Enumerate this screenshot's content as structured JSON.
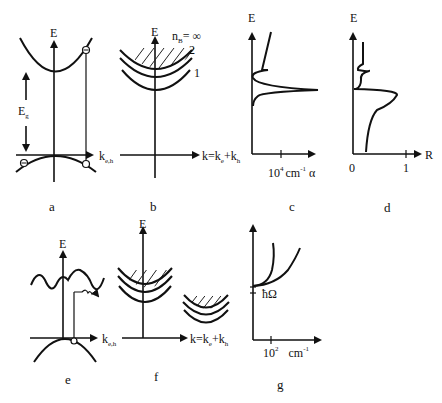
{
  "figure": {
    "panels": [
      {
        "id": "a",
        "caption": "a",
        "axis_y": "E",
        "axis_x": "k",
        "axis_x_sub": "e,h",
        "gap_label": "E",
        "gap_label_sub": "g"
      },
      {
        "id": "b",
        "caption": "b",
        "axis_y": "E",
        "axis_x": "k=k",
        "axis_x_sub1": "e",
        "axis_x_plus": "+k",
        "axis_x_sub2": "h",
        "series_label": "n",
        "series_sub": "B",
        "series_value": "= ∞",
        "level_2": "2",
        "level_1": "1"
      },
      {
        "id": "c",
        "caption": "c",
        "axis_y": "E",
        "axis_x": "α",
        "tick_label": "10",
        "tick_sup": "4",
        "unit": "cm",
        "unit_sup": "-1"
      },
      {
        "id": "d",
        "caption": "d",
        "axis_y": "E",
        "axis_x": "R",
        "tick_0": "0",
        "tick_1": "1"
      },
      {
        "id": "e",
        "caption": "e",
        "axis_y": "E",
        "axis_x": "k",
        "axis_x_sub": "e,h"
      },
      {
        "id": "f",
        "caption": "f",
        "axis_y": "E",
        "axis_x": "k=k",
        "axis_x_sub1": "e",
        "axis_x_plus": "+k",
        "axis_x_sub2": "h"
      },
      {
        "id": "g",
        "caption": "g",
        "phonon_label": "ħΩ",
        "tick_label": "10",
        "tick_sup": "2",
        "unit": "cm",
        "unit_sup": "-1"
      }
    ]
  }
}
